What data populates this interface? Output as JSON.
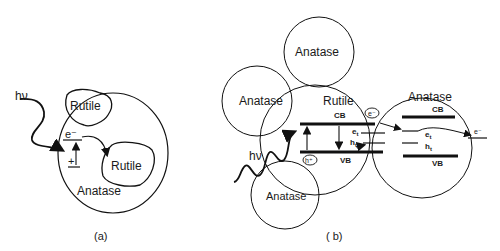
{
  "panel_a": {
    "caption": "(a)",
    "outer_particle": "Anatase",
    "rutile_top": "Rutile",
    "rutile_bottom": "Rutile",
    "photon": "hν",
    "electron": "e⁻",
    "hole": "+"
  },
  "panel_b": {
    "caption": "( b)",
    "anatase_top": "Anatase",
    "anatase_left": "Anatase",
    "anatase_bottom": "Anatase",
    "rutile_center": {
      "label": "Rutile",
      "cb": "CB",
      "vb": "VB",
      "electron_trap": "e",
      "electron_trap_sub": "t",
      "hole_trap": "h",
      "hole_trap_sub": "t",
      "electron_bubble": "e⁻",
      "hole_bubble": "h⁺"
    },
    "anatase_right": {
      "label": "Anatase",
      "cb": "CB",
      "vb": "VB",
      "electron_trap": "e",
      "electron_trap_sub": "t",
      "hole_trap": "h",
      "hole_trap_sub": "t",
      "electron_out": "e⁻"
    },
    "photon": "hν"
  }
}
